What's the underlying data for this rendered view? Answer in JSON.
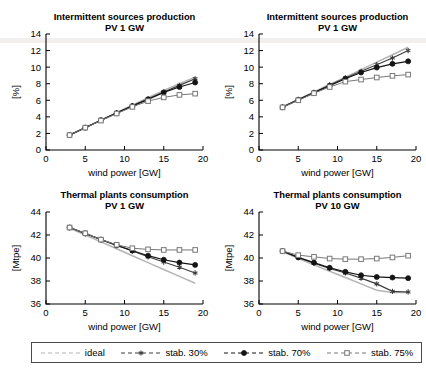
{
  "figure": {
    "width": 426,
    "height": 378,
    "colors": {
      "ideal": "#b4b4b4",
      "stab30": "#3c3c3c",
      "stab70": "#141414",
      "stab75": "#787878",
      "axis": "#000000"
    }
  },
  "legend": {
    "entries": [
      {
        "label": "ideal",
        "marker": "none",
        "color": "#b4b4b4",
        "dash": "dashed"
      },
      {
        "label": "stab. 30%",
        "marker": "star-icon",
        "color": "#3c3c3c",
        "dash": "dashed"
      },
      {
        "label": "stab. 70%",
        "marker": "filled-circle-icon",
        "color": "#141414",
        "dash": "dashed"
      },
      {
        "label": "stab. 75%",
        "marker": "open-square-icon",
        "color": "#787878",
        "dash": "dashed"
      }
    ]
  },
  "chart_data": [
    {
      "id": "top-left",
      "type": "line",
      "title": "Intermittent sources production",
      "subtitle": "PV 1 GW",
      "xlabel": "wind power [GW]",
      "ylabel": "[%]",
      "xlim": [
        0,
        20
      ],
      "ylim": [
        0,
        14
      ],
      "xticks": [
        0,
        5,
        10,
        15,
        20
      ],
      "yticks": [
        0,
        2,
        4,
        6,
        8,
        10,
        12,
        14
      ],
      "grid": false,
      "legend_position": "figure-bottom",
      "x": [
        3,
        5,
        7,
        9,
        11,
        13,
        15,
        17,
        19
      ],
      "series": [
        {
          "name": "ideal",
          "values": [
            1.8,
            2.7,
            3.6,
            4.5,
            5.4,
            6.3,
            7.2,
            8.0,
            8.8
          ]
        },
        {
          "name": "stab. 30%",
          "values": [
            1.8,
            2.7,
            3.6,
            4.5,
            5.35,
            6.2,
            7.0,
            7.8,
            8.6
          ]
        },
        {
          "name": "stab. 70%",
          "values": [
            1.8,
            2.7,
            3.6,
            4.45,
            5.3,
            6.1,
            6.95,
            7.6,
            8.15
          ]
        },
        {
          "name": "stab. 75%",
          "values": [
            1.8,
            2.7,
            3.55,
            4.4,
            5.2,
            5.9,
            6.35,
            6.65,
            6.8
          ]
        }
      ]
    },
    {
      "id": "top-right",
      "type": "line",
      "title": "Intermittent sources production",
      "subtitle": "PV 1 GW",
      "xlabel": "wind power [GW]",
      "ylabel": "[%]",
      "xlim": [
        0,
        20
      ],
      "ylim": [
        0,
        14
      ],
      "xticks": [
        0,
        5,
        10,
        15,
        20
      ],
      "yticks": [
        0,
        2,
        4,
        6,
        8,
        10,
        12,
        14
      ],
      "grid": false,
      "legend_position": "figure-bottom",
      "x": [
        3,
        5,
        7,
        9,
        11,
        13,
        15,
        17,
        19
      ],
      "series": [
        {
          "name": "ideal",
          "values": [
            5.2,
            6.1,
            7.0,
            7.9,
            8.8,
            9.7,
            10.6,
            11.5,
            12.4
          ]
        },
        {
          "name": "stab. 30%",
          "values": [
            5.2,
            6.1,
            6.95,
            7.85,
            8.7,
            9.5,
            10.3,
            11.1,
            12.0
          ]
        },
        {
          "name": "stab. 70%",
          "values": [
            5.15,
            6.05,
            6.9,
            7.75,
            8.6,
            9.35,
            9.95,
            10.4,
            10.7
          ]
        },
        {
          "name": "stab. 75%",
          "values": [
            5.15,
            6.0,
            6.85,
            7.6,
            8.25,
            8.5,
            8.75,
            8.95,
            9.1
          ]
        }
      ]
    },
    {
      "id": "bottom-left",
      "type": "line",
      "title": "Thermal plants consumption",
      "subtitle": "PV 1 GW",
      "xlabel": "wind power [GW]",
      "ylabel": "[Mtpe]",
      "xlim": [
        0,
        20
      ],
      "ylim": [
        36,
        44
      ],
      "xticks": [
        0,
        5,
        10,
        15,
        20
      ],
      "yticks": [
        36,
        38,
        40,
        42,
        44
      ],
      "grid": false,
      "legend_position": "figure-bottom",
      "x": [
        3,
        5,
        7,
        9,
        11,
        13,
        15,
        17,
        19
      ],
      "series": [
        {
          "name": "ideal",
          "values": [
            42.6,
            42.0,
            41.4,
            40.8,
            40.2,
            39.6,
            39.0,
            38.4,
            37.8
          ]
        },
        {
          "name": "stab. 30%",
          "values": [
            42.65,
            42.1,
            41.6,
            41.1,
            40.6,
            40.1,
            39.65,
            39.2,
            38.7
          ]
        },
        {
          "name": "stab. 70%",
          "values": [
            42.65,
            42.15,
            41.6,
            41.1,
            40.65,
            40.2,
            39.85,
            39.6,
            39.4
          ]
        },
        {
          "name": "stab. 75%",
          "values": [
            42.65,
            42.15,
            41.6,
            41.15,
            40.85,
            40.75,
            40.7,
            40.7,
            40.7
          ]
        }
      ]
    },
    {
      "id": "bottom-right",
      "type": "line",
      "title": "Thermal plants consumption",
      "subtitle": "PV 10 GW",
      "xlabel": "wind power [GW]",
      "ylabel": "[Mtpe]",
      "xlim": [
        0,
        20
      ],
      "ylim": [
        36,
        44
      ],
      "xticks": [
        0,
        5,
        10,
        15,
        20
      ],
      "yticks": [
        36,
        38,
        40,
        42,
        44
      ],
      "grid": false,
      "legend_position": "figure-bottom",
      "x": [
        3,
        5,
        7,
        9,
        11,
        13,
        15,
        17,
        19
      ],
      "series": [
        {
          "name": "ideal",
          "values": [
            40.55,
            39.95,
            39.4,
            38.85,
            38.3,
            37.75,
            37.2,
            37.0,
            37.0
          ]
        },
        {
          "name": "stab. 30%",
          "values": [
            40.6,
            40.05,
            39.55,
            39.1,
            38.7,
            38.25,
            37.75,
            37.1,
            37.05
          ]
        },
        {
          "name": "stab. 70%",
          "values": [
            40.6,
            40.05,
            39.6,
            39.15,
            38.8,
            38.5,
            38.35,
            38.3,
            38.25
          ]
        },
        {
          "name": "stab. 75%",
          "values": [
            40.6,
            40.25,
            40.1,
            39.95,
            39.9,
            39.9,
            39.95,
            40.05,
            40.2
          ]
        }
      ]
    }
  ]
}
